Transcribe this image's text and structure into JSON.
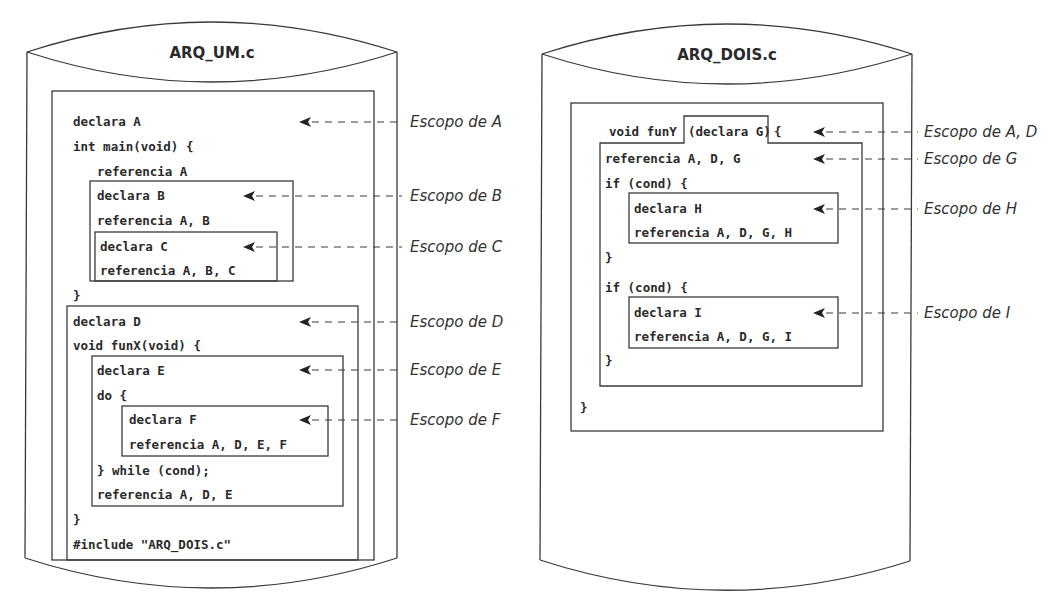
{
  "files": {
    "left": {
      "title": "ARQ_UM.c",
      "lines": {
        "declara_a": "declara A",
        "int_main": "int main(void) {",
        "referencia_a": "referencia A",
        "declara_b": "declara B",
        "referencia_ab": "referencia A, B",
        "declara_c": "declara C",
        "referencia_abc": "referencia A, B, C",
        "close_main": "}",
        "declara_d": "declara D",
        "void_funx": "void funX(void) {",
        "declara_e": "declara E",
        "do_open": "do {",
        "declara_f": "declara F",
        "referencia_adef": "referencia A, D, E, F",
        "while_cond": "} while (cond);",
        "referencia_ade": "referencia A, D, E",
        "close_funx": "}",
        "include": "#include \"ARQ_DOIS.c\""
      },
      "scope_labels": {
        "a": "Escopo de A",
        "b": "Escopo de B",
        "c": "Escopo de C",
        "d": "Escopo de D",
        "e": "Escopo de E",
        "f": "Escopo de F"
      }
    },
    "right": {
      "title": "ARQ_DOIS.c",
      "lines": {
        "void_funy": "void funY",
        "declara_g": "(declara G)",
        "brace_open": "{",
        "referencia_adg": "referencia A, D, G",
        "if_cond_1": "if (cond) {",
        "declara_h": "declara H",
        "referencia_adgh": "referencia A, D, G, H",
        "close_if_1": "}",
        "if_cond_2": "if (cond) {",
        "declara_i": "declara I",
        "referencia_adgi": "referencia A, D, G, I",
        "close_if_2": "}",
        "close_funy": "}"
      },
      "scope_labels": {
        "ad": "Escopo de A, D",
        "g": "Escopo de G",
        "h": "Escopo de H",
        "i": "Escopo de I"
      }
    }
  },
  "colors": {
    "stroke": "#3a3a3a",
    "text": "#2a2a2a",
    "background": "#ffffff"
  }
}
